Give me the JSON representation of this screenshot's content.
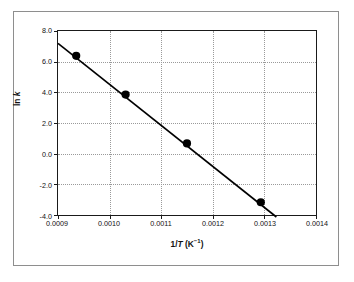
{
  "chart_data": {
    "type": "scatter",
    "title": "",
    "xlabel": "1/T (K⁻¹)",
    "xlabel_parts": {
      "prefix": "1/",
      "italic": "T",
      "unit_open": " (K",
      "exponent": "−1",
      "unit_close": ")"
    },
    "ylabel": "ln k",
    "ylabel_parts": {
      "prefix": "ln ",
      "italic": "k"
    },
    "xlim": [
      0.0009,
      0.0014
    ],
    "ylim": [
      -4.0,
      8.0
    ],
    "xticks": [
      0.0009,
      0.001,
      0.0011,
      0.0012,
      0.0013,
      0.0014
    ],
    "xticklabels": [
      "0.0009",
      "0.0010",
      "0.0011",
      "0.0012",
      "0.0013",
      "0.0014"
    ],
    "yticks": [
      -4.0,
      -2.0,
      0.0,
      2.0,
      4.0,
      6.0,
      8.0
    ],
    "yticklabels": [
      "-4.0",
      "-2.0",
      "0.0",
      "2.0",
      "4.0",
      "6.0",
      "8.0"
    ],
    "grid": true,
    "grid_style": "dotted",
    "legend": false,
    "series": [
      {
        "name": "data",
        "marker": "filled-circle",
        "marker_color": "#000000",
        "x": [
          0.000935,
          0.00103,
          0.001148,
          0.00129
        ],
        "y": [
          6.4,
          3.9,
          0.75,
          -3.05
        ]
      }
    ],
    "trendline": {
      "name": "best-fit line",
      "color": "#000000",
      "x": [
        0.0009,
        0.00132
      ],
      "y": [
        7.2,
        -4.0
      ]
    },
    "colors": {
      "axis": "#1a1a1a",
      "grid": "#9a9a9a",
      "marker": "#000000",
      "line": "#000000",
      "frame": "#8e8e8e",
      "background": "#ffffff"
    }
  }
}
